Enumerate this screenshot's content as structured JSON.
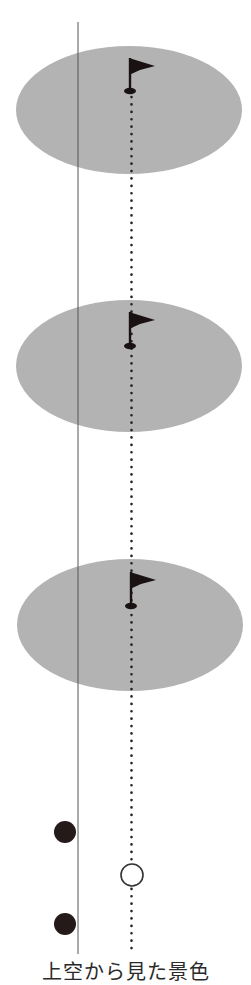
{
  "diagram": {
    "caption": "上空から見た景色",
    "colors": {
      "green": "#b3b3b3",
      "line": "#555555",
      "dots": "#222222",
      "flag": "#1a1212",
      "ball_dark": "#241a1a",
      "ball_light": "#ffffff"
    },
    "greens": [
      {
        "label": "green-1",
        "cx": 129,
        "cy": 110,
        "rx": 113,
        "ry": 64,
        "flag_x": 130,
        "flag_top": 58,
        "hole_y": 91
      },
      {
        "label": "green-2",
        "cx": 129,
        "cy": 366,
        "rx": 113,
        "ry": 66,
        "flag_x": 130,
        "flag_top": 312,
        "hole_y": 346
      },
      {
        "label": "green-3",
        "cx": 130,
        "cy": 625,
        "rx": 113,
        "ry": 66,
        "flag_x": 131,
        "flag_top": 572,
        "hole_y": 606
      }
    ],
    "vertical_line": {
      "x": 78,
      "y1": 22,
      "y2": 954
    },
    "target_line": {
      "x": 132,
      "y1": 95,
      "y2": 954
    },
    "balls": [
      {
        "type": "dark",
        "cx": 65,
        "cy": 832,
        "r": 11
      },
      {
        "type": "dark",
        "cx": 65,
        "cy": 924,
        "r": 11
      },
      {
        "type": "white",
        "cx": 132,
        "cy": 875,
        "r": 11
      }
    ]
  }
}
